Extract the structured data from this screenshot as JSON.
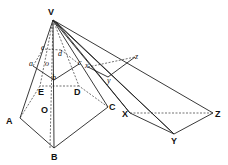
{
  "diagram": {
    "points": {
      "V": {
        "label": "V",
        "x": 53,
        "y": 20
      },
      "A": {
        "label": "A",
        "x": 20,
        "y": 118
      },
      "B": {
        "label": "B",
        "x": 54,
        "y": 148
      },
      "C": {
        "label": "C",
        "x": 108,
        "y": 107
      },
      "D": {
        "label": "D",
        "x": 79,
        "y": 86
      },
      "E": {
        "label": "E",
        "x": 40,
        "y": 86
      },
      "O": {
        "label": "O"
      },
      "a": {
        "label": "a",
        "x": 33,
        "y": 66
      },
      "b": {
        "label": "b",
        "x": 54,
        "y": 80
      },
      "c": {
        "label": "c",
        "x": 79,
        "y": 64
      },
      "d": {
        "label": "d",
        "x": 61,
        "y": 50
      },
      "e": {
        "label": "e",
        "x": 43,
        "y": 49
      },
      "o": {
        "label": "o"
      },
      "x": {
        "label": "x",
        "x": 88,
        "y": 67
      },
      "y": {
        "label": "y",
        "x": 108,
        "y": 77
      },
      "z": {
        "label": "z",
        "x": 135,
        "y": 57
      },
      "X": {
        "label": "X",
        "x": 130,
        "y": 113
      },
      "Y": {
        "label": "Y",
        "x": 174,
        "y": 134
      },
      "Z": {
        "label": "Z",
        "x": 213,
        "y": 113
      }
    }
  }
}
